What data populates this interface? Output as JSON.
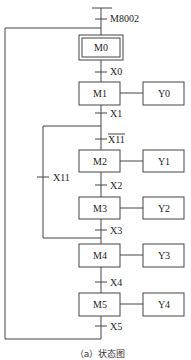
{
  "caption": "（a）状态图",
  "initial_transition": "M8002",
  "states": [
    {
      "id": "M0",
      "label": "M0",
      "initial": true,
      "action": null
    },
    {
      "id": "M1",
      "label": "M1",
      "action": "Y0"
    },
    {
      "id": "M2",
      "label": "M2",
      "action": "Y1"
    },
    {
      "id": "M3",
      "label": "M3",
      "action": "Y2"
    },
    {
      "id": "M4",
      "label": "M4",
      "action": "Y3"
    },
    {
      "id": "M5",
      "label": "M5",
      "action": "Y4"
    }
  ],
  "transitions": {
    "t_m8002": "M8002",
    "t_x0": "X0",
    "t_x1": "X1",
    "t_x11_not": "X11",
    "t_x11_skip": "X11",
    "t_x2": "X2",
    "t_x3": "X3",
    "t_x4": "X4",
    "t_x5": "X5"
  },
  "colors": {
    "line": "#444444",
    "text": "#222222",
    "background": "#ffffff"
  }
}
